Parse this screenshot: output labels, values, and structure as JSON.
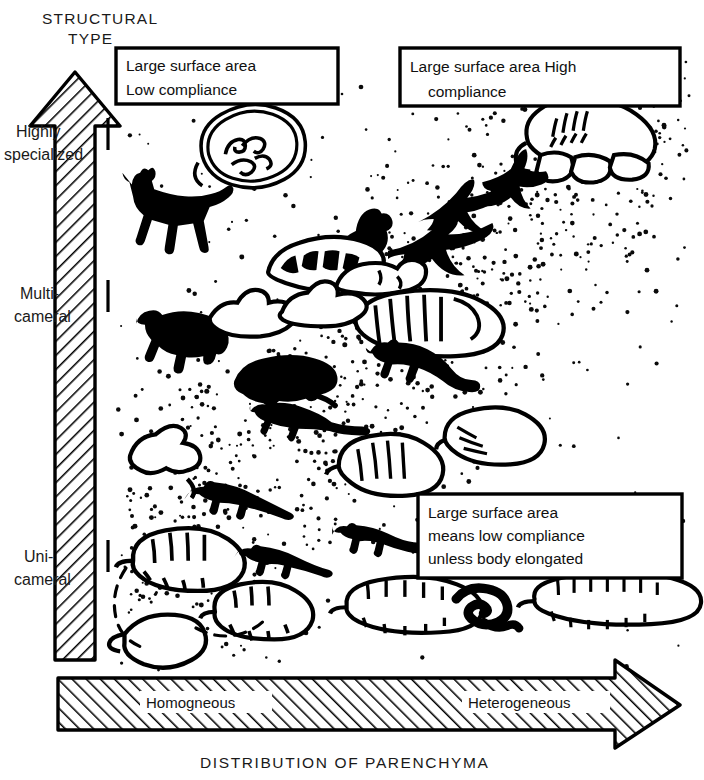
{
  "figure": {
    "background_color": "#ffffff",
    "ink_color": "#000000",
    "type": "scatter-concept-diagram"
  },
  "axes": {
    "y": {
      "title_line1": "STRUCTURAL",
      "title_line2": "TYPE",
      "direction": "upward-arrow",
      "ticks": [
        {
          "line1": "Highly",
          "line2": "specialized"
        },
        {
          "line1": "Multi-",
          "line2": "cameral"
        },
        {
          "line1": "Uni-",
          "line2": "cameral"
        }
      ]
    },
    "x": {
      "title": "DISTRIBUTION OF PARENCHYMA",
      "direction": "rightward-arrow",
      "left_label": "Homogneous",
      "right_label": "Heterogeneous"
    }
  },
  "callouts": [
    {
      "id": "top-left",
      "lines": [
        "Large surface area",
        "Low compliance"
      ]
    },
    {
      "id": "top-right",
      "lines": [
        "Large surface area High",
        "compliance"
      ]
    },
    {
      "id": "bottom-right",
      "lines": [
        "Large surface area",
        "means low compliance",
        "unless body elongated"
      ]
    }
  ],
  "chart_data": {
    "type": "scatter",
    "title": "",
    "xlabel": "DISTRIBUTION OF PARENCHYMA",
    "ylabel": "STRUCTURAL TYPE",
    "xlim": [
      "Homogneous",
      "Heterogeneous"
    ],
    "ylim": [
      "Uni-cameral",
      "Highly specialized"
    ],
    "grid": false,
    "legend": "none",
    "annotations": [
      "Large surface area Low compliance",
      "Large surface area High compliance",
      "Large surface area means low compliance unless body elongated"
    ],
    "points": [
      {
        "label": "horse",
        "kind": "animal-silhouette",
        "x": 0.18,
        "y": 0.86
      },
      {
        "label": "mammal-lung",
        "kind": "lung-outline",
        "x": 0.28,
        "y": 0.92
      },
      {
        "label": "bird-lung",
        "kind": "lung-outline",
        "x": 0.9,
        "y": 0.95
      },
      {
        "label": "swift",
        "kind": "animal-silhouette",
        "x": 0.76,
        "y": 0.87
      },
      {
        "label": "gull",
        "kind": "animal-silhouette",
        "x": 0.7,
        "y": 0.78
      },
      {
        "label": "pterosaur",
        "kind": "animal-silhouette",
        "x": 0.58,
        "y": 0.75
      },
      {
        "label": "crocodile-lung",
        "kind": "lung-outline",
        "x": 0.4,
        "y": 0.7
      },
      {
        "label": "reptile-lung",
        "kind": "lung-outline",
        "x": 0.5,
        "y": 0.71
      },
      {
        "label": "turtle-lung",
        "kind": "lung-outline",
        "x": 0.6,
        "y": 0.64
      },
      {
        "label": "bear",
        "kind": "animal-silhouette",
        "x": 0.12,
        "y": 0.6
      },
      {
        "label": "bear-lung",
        "kind": "lung-outline",
        "x": 0.24,
        "y": 0.62
      },
      {
        "label": "shrew-lung",
        "kind": "lung-outline",
        "x": 0.35,
        "y": 0.62
      },
      {
        "label": "monitor-lizard",
        "kind": "animal-silhouette",
        "x": 0.52,
        "y": 0.57
      },
      {
        "label": "hedgehog",
        "kind": "animal-silhouette",
        "x": 0.28,
        "y": 0.52
      },
      {
        "label": "shrew",
        "kind": "animal-silhouette",
        "x": 0.32,
        "y": 0.46
      },
      {
        "label": "amphibian-lung",
        "kind": "lung-outline",
        "x": 0.13,
        "y": 0.4
      },
      {
        "label": "lizard-lung",
        "kind": "lung-outline",
        "x": 0.47,
        "y": 0.4
      },
      {
        "label": "chameleon-lung",
        "kind": "lung-outline",
        "x": 0.62,
        "y": 0.43
      },
      {
        "label": "lizard",
        "kind": "animal-silhouette",
        "x": 0.22,
        "y": 0.33
      },
      {
        "label": "salamander-lung",
        "kind": "lung-outline",
        "x": 0.14,
        "y": 0.26
      },
      {
        "label": "newt",
        "kind": "animal-silhouette",
        "x": 0.3,
        "y": 0.22
      },
      {
        "label": "salamander",
        "kind": "animal-silhouette",
        "x": 0.45,
        "y": 0.25
      },
      {
        "label": "sac-lung-small",
        "kind": "lung-outline",
        "x": 0.27,
        "y": 0.16
      },
      {
        "label": "sac-lung-plain",
        "kind": "lung-outline",
        "x": 0.08,
        "y": 0.1
      },
      {
        "label": "caecilian-lung",
        "kind": "lung-outline",
        "x": 0.45,
        "y": 0.17
      },
      {
        "label": "snake",
        "kind": "animal-silhouette",
        "x": 0.62,
        "y": 0.17
      },
      {
        "label": "snake-lung",
        "kind": "lung-outline",
        "x": 0.78,
        "y": 0.17
      }
    ]
  }
}
